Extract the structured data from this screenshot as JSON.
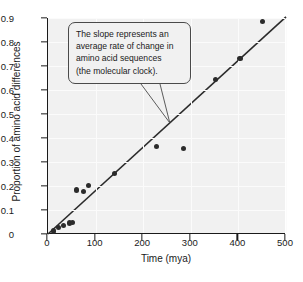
{
  "chart_data": {
    "type": "scatter",
    "title": "",
    "xlabel": "Time (mya)",
    "ylabel": "Proportion of amino acid differences",
    "xlim": [
      0,
      500
    ],
    "ylim": [
      0,
      0.9
    ],
    "xticks": [
      0,
      100,
      200,
      300,
      400,
      500
    ],
    "xtick_labels": [
      "0",
      "100",
      "200",
      "300",
      "400",
      "500"
    ],
    "yticks": [
      0,
      0.1,
      0.2,
      0.3,
      0.4,
      0.5,
      0.6,
      0.7,
      0.8,
      0.9
    ],
    "ytick_labels": [
      "0",
      "0.1",
      "0.2",
      "0.3",
      "0.4",
      "0.5",
      "0.6",
      "0.7",
      "0.8",
      "0.9"
    ],
    "grid": true,
    "legend": null,
    "points": [
      {
        "x": 12,
        "y": 0.012
      },
      {
        "x": 22,
        "y": 0.028
      },
      {
        "x": 32,
        "y": 0.035
      },
      {
        "x": 45,
        "y": 0.046
      },
      {
        "x": 52,
        "y": 0.047
      },
      {
        "x": 60,
        "y": 0.183
      },
      {
        "x": 75,
        "y": 0.176
      },
      {
        "x": 85,
        "y": 0.203
      },
      {
        "x": 140,
        "y": 0.252
      },
      {
        "x": 228,
        "y": 0.364
      },
      {
        "x": 285,
        "y": 0.357
      },
      {
        "x": 352,
        "y": 0.643
      },
      {
        "x": 403,
        "y": 0.731
      },
      {
        "x": 450,
        "y": 0.885
      }
    ],
    "trendline": {
      "x0": 0,
      "y0": 0.0,
      "x1": 500,
      "y1": 0.905
    },
    "annotations": [
      {
        "name": "slope-callout",
        "lines": [
          "The slope represents an",
          "average rate of change in",
          "amino acid sequences",
          "(the molecular clock)."
        ],
        "pointer_target_x": 258,
        "pointer_target_y": 0.463
      }
    ]
  },
  "colors": {
    "plot_background": "#f1f1f1",
    "axis": "#1a1a1a",
    "point": "#2b2b2b",
    "trendline": "#2b2b2b",
    "gridline": "#fbfbfb",
    "callout_border": "#4a4a4a"
  }
}
